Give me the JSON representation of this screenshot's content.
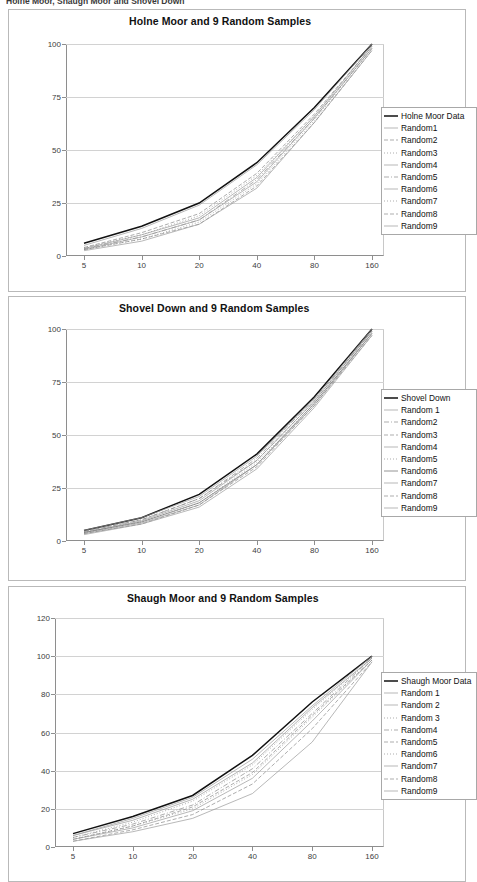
{
  "document": {
    "heading": "Holne Moor, Shaugh Moor and Shovel Down"
  },
  "charts": [
    {
      "id": "holne-moor",
      "title": "Holne Moor and 9 Random Samples",
      "legend": [
        {
          "label": "Holne Moor Data",
          "style": "solid-bold"
        },
        {
          "label": "Random1",
          "style": "thin"
        },
        {
          "label": "Random2",
          "style": "dash"
        },
        {
          "label": "Random3",
          "style": "dot"
        },
        {
          "label": "Random4",
          "style": "thin"
        },
        {
          "label": "Random5",
          "style": "dashdot"
        },
        {
          "label": "Random6",
          "style": "thin"
        },
        {
          "label": "Random7",
          "style": "dot"
        },
        {
          "label": "Random8",
          "style": "dash"
        },
        {
          "label": "Random9",
          "style": "thin"
        }
      ]
    },
    {
      "id": "shovel-down",
      "title": "Shovel Down and 9 Random Samples",
      "legend": [
        {
          "label": "Shovel Down",
          "style": "solid-bold"
        },
        {
          "label": "Random 1",
          "style": "thin"
        },
        {
          "label": "Random2",
          "style": "dashdot"
        },
        {
          "label": "Random3",
          "style": "dash"
        },
        {
          "label": "Random4",
          "style": "thin"
        },
        {
          "label": "Random5",
          "style": "dot"
        },
        {
          "label": "Random6",
          "style": "solid"
        },
        {
          "label": "Random7",
          "style": "thin"
        },
        {
          "label": "Random8",
          "style": "dash"
        },
        {
          "label": "Random9",
          "style": "thin"
        }
      ]
    },
    {
      "id": "shaugh-moor",
      "title": "Shaugh Moor and 9 Random Samples",
      "legend": [
        {
          "label": "Shaugh Moor Data",
          "style": "solid-bold"
        },
        {
          "label": "Random 1",
          "style": "thin"
        },
        {
          "label": "Random 2",
          "style": "thin"
        },
        {
          "label": "Random 3",
          "style": "dot"
        },
        {
          "label": "Random4",
          "style": "dashdot"
        },
        {
          "label": "Random5",
          "style": "dash"
        },
        {
          "label": "Random6",
          "style": "dot"
        },
        {
          "label": "Random7",
          "style": "thin"
        },
        {
          "label": "Random8",
          "style": "dash"
        },
        {
          "label": "Random9",
          "style": "thin"
        }
      ]
    }
  ],
  "chart_data": [
    {
      "type": "line",
      "title": "Holne Moor and 9 Random Samples",
      "xlabel": "",
      "ylabel": "",
      "x": [
        5,
        10,
        20,
        40,
        80,
        160
      ],
      "xscale": "log2",
      "xticks": [
        5,
        10,
        20,
        40,
        80,
        160
      ],
      "yticks": [
        0,
        25,
        50,
        75,
        100
      ],
      "ylim": [
        0,
        100
      ],
      "grid": true,
      "legend_position": "right",
      "series": [
        {
          "name": "Holne Moor Data",
          "style": "solid-bold",
          "values": [
            6,
            14,
            25,
            44,
            70,
            100
          ]
        },
        {
          "name": "Random1",
          "style": "thin",
          "values": [
            5,
            13,
            24,
            43,
            69,
            100
          ]
        },
        {
          "name": "Random2",
          "style": "dash",
          "values": [
            4,
            11,
            20,
            39,
            67,
            99
          ]
        },
        {
          "name": "Random3",
          "style": "dot",
          "values": [
            4,
            10,
            19,
            38,
            66,
            99
          ]
        },
        {
          "name": "Random4",
          "style": "thin",
          "values": [
            3.5,
            10,
            18,
            37,
            66,
            99
          ]
        },
        {
          "name": "Random5",
          "style": "dashdot",
          "values": [
            3.5,
            9,
            17,
            36,
            65,
            98
          ]
        },
        {
          "name": "Random6",
          "style": "thin",
          "values": [
            3,
            9,
            17,
            35,
            65,
            98
          ]
        },
        {
          "name": "Random7",
          "style": "dot",
          "values": [
            3,
            8,
            16,
            34,
            64,
            98
          ]
        },
        {
          "name": "Random8",
          "style": "dash",
          "values": [
            3,
            8,
            15,
            33,
            63,
            97
          ]
        },
        {
          "name": "Random9",
          "style": "thin",
          "values": [
            2.5,
            7,
            15,
            32,
            63,
            97
          ]
        }
      ]
    },
    {
      "type": "line",
      "title": "Shovel Down and 9 Random Samples",
      "xlabel": "",
      "ylabel": "",
      "x": [
        5,
        10,
        20,
        40,
        80,
        160
      ],
      "xscale": "log2",
      "xticks": [
        5,
        10,
        20,
        40,
        80,
        160
      ],
      "yticks": [
        0,
        25,
        50,
        75,
        100
      ],
      "ylim": [
        0,
        100
      ],
      "grid": true,
      "legend_position": "right",
      "series": [
        {
          "name": "Shovel Down",
          "style": "solid-bold",
          "values": [
            5,
            11,
            22,
            41,
            68,
            100
          ]
        },
        {
          "name": "Random 1",
          "style": "thin",
          "values": [
            5,
            11,
            21,
            40,
            67,
            100
          ]
        },
        {
          "name": "Random2",
          "style": "dashdot",
          "values": [
            4.5,
            10,
            20,
            39,
            67,
            99
          ]
        },
        {
          "name": "Random3",
          "style": "dash",
          "values": [
            4.5,
            10,
            20,
            38,
            66,
            99
          ]
        },
        {
          "name": "Random4",
          "style": "thin",
          "values": [
            4,
            9.5,
            19,
            38,
            66,
            99
          ]
        },
        {
          "name": "Random5",
          "style": "dot",
          "values": [
            4,
            9,
            18,
            37,
            65,
            98
          ]
        },
        {
          "name": "Random6",
          "style": "solid",
          "values": [
            4,
            9,
            18,
            36,
            65,
            98
          ]
        },
        {
          "name": "Random7",
          "style": "thin",
          "values": [
            3.5,
            8.5,
            17,
            36,
            64,
            98
          ]
        },
        {
          "name": "Random8",
          "style": "dash",
          "values": [
            3.5,
            8,
            17,
            35,
            64,
            97
          ]
        },
        {
          "name": "Random9",
          "style": "thin",
          "values": [
            3,
            8,
            16,
            34,
            63,
            97
          ]
        }
      ]
    },
    {
      "type": "line",
      "title": "Shaugh Moor and 9 Random Samples",
      "xlabel": "",
      "ylabel": "",
      "x": [
        5,
        10,
        20,
        40,
        80,
        160
      ],
      "xscale": "log2",
      "xticks": [
        5,
        10,
        20,
        40,
        80,
        160
      ],
      "yticks": [
        0,
        20,
        40,
        60,
        80,
        100,
        120
      ],
      "ylim": [
        0,
        120
      ],
      "grid": true,
      "legend_position": "right",
      "series": [
        {
          "name": "Shaugh Moor Data",
          "style": "solid-bold",
          "values": [
            7,
            16,
            27,
            48,
            76,
            100
          ]
        },
        {
          "name": "Random 1",
          "style": "thin",
          "values": [
            6,
            15,
            26,
            46,
            74,
            100
          ]
        },
        {
          "name": "Random 2",
          "style": "thin",
          "values": [
            6,
            14,
            25,
            44,
            73,
            99
          ]
        },
        {
          "name": "Random 3",
          "style": "dot",
          "values": [
            5,
            13,
            24,
            43,
            72,
            99
          ]
        },
        {
          "name": "Random4",
          "style": "dashdot",
          "values": [
            5,
            12,
            22,
            41,
            70,
            99
          ]
        },
        {
          "name": "Random5",
          "style": "dash",
          "values": [
            4,
            11,
            21,
            39,
            69,
            98
          ]
        },
        {
          "name": "Random6",
          "style": "dot",
          "values": [
            4,
            11,
            20,
            38,
            68,
            98
          ]
        },
        {
          "name": "Random7",
          "style": "thin",
          "values": [
            4,
            10,
            19,
            36,
            66,
            98
          ]
        },
        {
          "name": "Random8",
          "style": "dash",
          "values": [
            3,
            9,
            17,
            33,
            62,
            97
          ]
        },
        {
          "name": "Random9",
          "style": "thin",
          "values": [
            3,
            8,
            15,
            28,
            55,
            97
          ]
        }
      ]
    }
  ]
}
